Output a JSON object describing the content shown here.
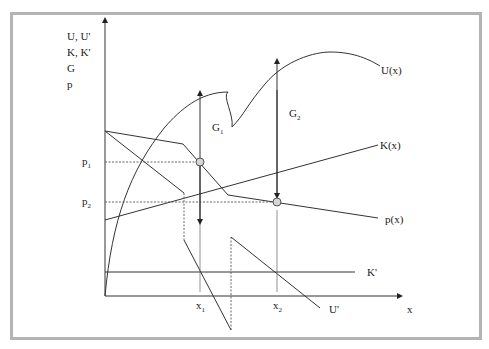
{
  "diagram": {
    "y_axis_labels": [
      "U, U'",
      "K, K'",
      "G",
      "p"
    ],
    "x_axis_label": "x",
    "curve_labels": {
      "U": "U(x)",
      "K": "K(x)",
      "p": "p(x)",
      "K_prime": "K'",
      "U_prime": "U'"
    },
    "gap_labels": {
      "G1": {
        "main": "G",
        "sub": "1"
      },
      "G2": {
        "main": "G",
        "sub": "2"
      }
    },
    "y_ticks": {
      "p1": {
        "main": "p",
        "sub": "1"
      },
      "p2": {
        "main": "p",
        "sub": "2"
      }
    },
    "x_ticks": {
      "x1": {
        "main": "x",
        "sub": "1"
      },
      "x2": {
        "main": "x",
        "sub": "2"
      }
    },
    "colors": {
      "frame": "#b4b4b4",
      "lines": "#333333",
      "markers": "#d6d6d6"
    }
  }
}
